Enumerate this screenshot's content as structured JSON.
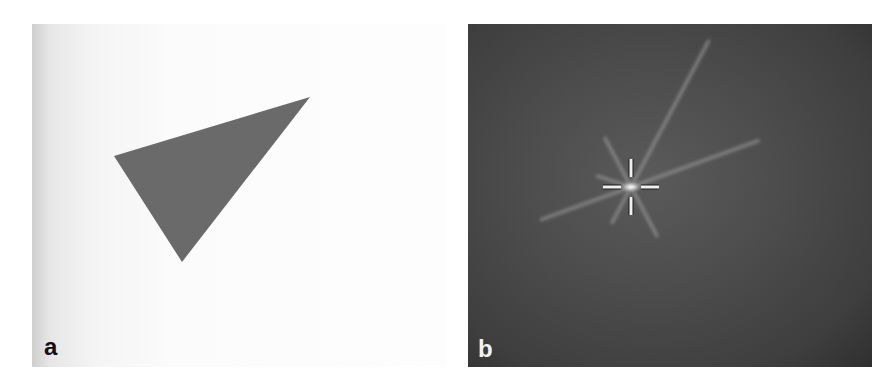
{
  "figure": {
    "panels": [
      {
        "id": "a",
        "label": "a",
        "description": "Dark gray triangle on a light background",
        "background_color": "#f8f8f8",
        "shape": {
          "type": "triangle",
          "fill": "#6a6a6a",
          "vertices": [
            [
              82,
              132
            ],
            [
              278,
              73
            ],
            [
              150,
              238
            ]
          ]
        }
      },
      {
        "id": "b",
        "label": "b",
        "description": "Dark field with a bright central spot, radiating streaks, and a crosshair marker",
        "background_color": "#474747",
        "crosshair": {
          "center": [
            163,
            163
          ],
          "color": "#f0f0f0",
          "arm_length": 18,
          "gap": 10
        },
        "rays": [
          {
            "angle_deg": -62,
            "length": 165
          },
          {
            "angle_deg": -20,
            "length": 135
          },
          {
            "angle_deg": 160,
            "length": 95
          },
          {
            "angle_deg": -118,
            "length": 55
          },
          {
            "angle_deg": 62,
            "length": 55
          },
          {
            "angle_deg": 118,
            "length": 40
          },
          {
            "angle_deg": 198,
            "length": 35
          }
        ]
      }
    ]
  }
}
